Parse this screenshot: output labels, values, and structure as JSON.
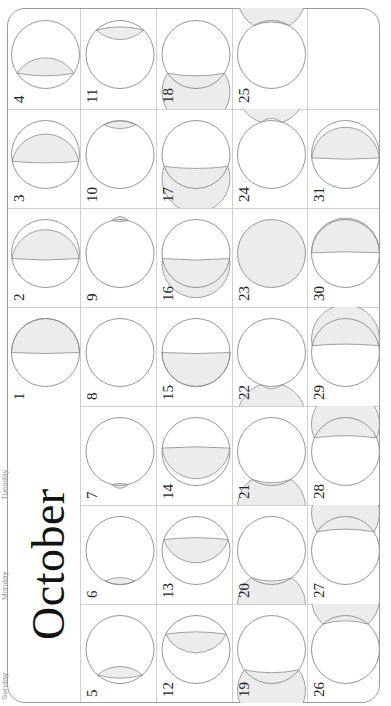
{
  "calendar": {
    "month": "October",
    "orientation": "rotated-90-ccw",
    "weekdays": [
      "Sunday",
      "Monday",
      "Tuesday",
      "Wednesday",
      "Thursday",
      "Friday",
      "Saturday"
    ],
    "colors": {
      "outline": "#8a8a8a",
      "shade": "#ececec",
      "grid": "#cfcfcf",
      "text": "#222222"
    },
    "days": [
      {
        "day": "1",
        "shade": "below",
        "t": 0.0
      },
      {
        "day": "2",
        "shade": "below",
        "t": 0.15
      },
      {
        "day": "3",
        "shade": "below",
        "t": 0.2
      },
      {
        "day": "4",
        "shade": "below",
        "t": 0.55
      },
      {
        "day": "5",
        "shade": "below",
        "t": 0.75
      },
      {
        "day": "6",
        "shade": "below",
        "t": 0.9
      },
      {
        "day": "7",
        "shade": "below",
        "t": 0.97
      },
      {
        "day": "8",
        "shade": "none",
        "t": 0
      },
      {
        "day": "9",
        "shade": "above",
        "t": -0.97
      },
      {
        "day": "10",
        "shade": "above",
        "t": -0.88
      },
      {
        "day": "11",
        "shade": "above",
        "t": -0.72
      },
      {
        "day": "12",
        "shade": "above",
        "t": -0.45
      },
      {
        "day": "13",
        "shade": "above",
        "t": -0.32
      },
      {
        "day": "14",
        "shade": "above",
        "t": -0.1
      },
      {
        "day": "15",
        "shade": "above",
        "t": 0.0
      },
      {
        "day": "16",
        "shade": "above",
        "t": 0.15
      },
      {
        "day": "17",
        "shade": "above",
        "t": 0.35
      },
      {
        "day": "18",
        "shade": "above",
        "t": 0.55
      },
      {
        "day": "19",
        "shade": "above",
        "t": 0.6
      },
      {
        "day": "20",
        "shade": "above",
        "t": 0.8
      },
      {
        "day": "21",
        "shade": "above",
        "t": 0.82
      },
      {
        "day": "22",
        "shade": "above",
        "t": 0.95
      },
      {
        "day": "23",
        "shade": "full",
        "t": 0
      },
      {
        "day": "24",
        "shade": "below",
        "t": -0.95
      },
      {
        "day": "25",
        "shade": "below",
        "t": -0.85
      },
      {
        "day": "26",
        "shade": "below",
        "t": -0.75
      },
      {
        "day": "27",
        "shade": "below",
        "t": -0.55
      },
      {
        "day": "28",
        "shade": "below",
        "t": -0.4
      },
      {
        "day": "29",
        "shade": "below",
        "t": -0.2
      },
      {
        "day": "30",
        "shade": "below",
        "t": -0.02
      },
      {
        "day": "31",
        "shade": "below",
        "t": 0.1
      }
    ]
  }
}
